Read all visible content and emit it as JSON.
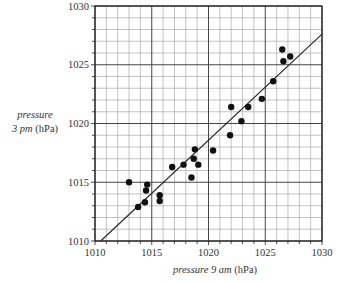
{
  "chart_data": {
    "type": "scatter",
    "title": "",
    "xlabel": "pressure 9 am (hPa)",
    "ylabel": "pressure 3 pm (hPa)",
    "xlabel_italic": "pressure 9 am",
    "xlabel_unit": "(hPa)",
    "ylabel_italic_line1": "pressure",
    "ylabel_italic_line2": "3 pm",
    "ylabel_unit": "(hPa)",
    "xlim": [
      1010,
      1030
    ],
    "ylim": [
      1010,
      1030
    ],
    "x_ticks": [
      1010,
      1015,
      1020,
      1025,
      1030
    ],
    "y_ticks": [
      1010,
      1015,
      1020,
      1025,
      1030
    ],
    "grid": true,
    "minor_grid_step": 1,
    "major_grid_step": 5,
    "points": [
      {
        "x": 1013.0,
        "y": 1015.0
      },
      {
        "x": 1013.8,
        "y": 1012.9
      },
      {
        "x": 1014.4,
        "y": 1013.3
      },
      {
        "x": 1014.5,
        "y": 1014.3
      },
      {
        "x": 1014.6,
        "y": 1014.8
      },
      {
        "x": 1015.7,
        "y": 1013.9
      },
      {
        "x": 1015.7,
        "y": 1013.4
      },
      {
        "x": 1016.8,
        "y": 1016.3
      },
      {
        "x": 1017.8,
        "y": 1016.5
      },
      {
        "x": 1018.5,
        "y": 1015.4
      },
      {
        "x": 1018.7,
        "y": 1017.0
      },
      {
        "x": 1018.8,
        "y": 1017.8
      },
      {
        "x": 1019.1,
        "y": 1016.5
      },
      {
        "x": 1020.4,
        "y": 1017.7
      },
      {
        "x": 1021.9,
        "y": 1019.0
      },
      {
        "x": 1022.0,
        "y": 1021.4
      },
      {
        "x": 1022.9,
        "y": 1020.2
      },
      {
        "x": 1023.5,
        "y": 1021.4
      },
      {
        "x": 1024.7,
        "y": 1022.1
      },
      {
        "x": 1025.7,
        "y": 1023.6
      },
      {
        "x": 1026.5,
        "y": 1026.3
      },
      {
        "x": 1026.6,
        "y": 1025.3
      },
      {
        "x": 1027.2,
        "y": 1025.7
      }
    ],
    "regression_line": {
      "x1": 1010.5,
      "y1": 1010.0,
      "x2": 1030.0,
      "y2": 1027.6
    },
    "legend": null
  },
  "colors": {
    "axis": "#222222",
    "minor_grid": "#9a9a9a",
    "major_grid": "#444444",
    "points": "#111111",
    "line": "#222222"
  }
}
